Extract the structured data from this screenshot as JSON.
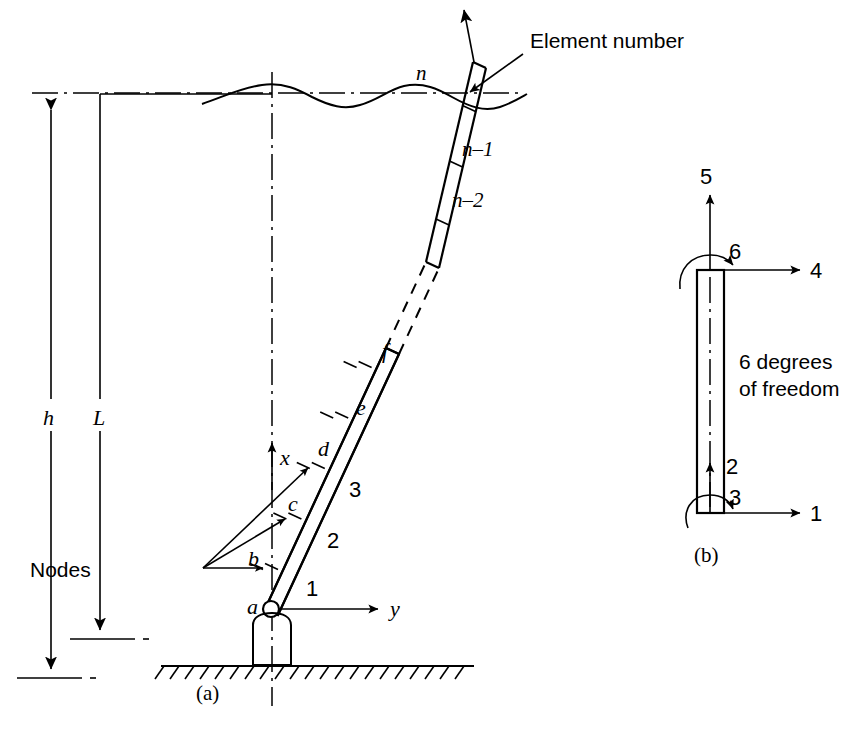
{
  "figure": {
    "domain": "engineering-diagram",
    "background": "#ffffff",
    "ink": "#000000",
    "panels": [
      {
        "key": "a",
        "caption": "(a)",
        "description": "Offshore pile / column discretized into finite elements with nodes, water surface wave, and global x-y axes"
      },
      {
        "key": "b",
        "caption": "(b)",
        "description": "Single beam element showing its six degrees of freedom"
      }
    ]
  },
  "panel_a": {
    "caption": "(a)",
    "annotation_element_number": "Element number",
    "annotation_nodes": "Nodes",
    "dimensions": [
      {
        "name": "h",
        "label": "h",
        "meaning": "total height from mudline to top"
      },
      {
        "name": "L",
        "label": "L",
        "meaning": "submerged / water depth length"
      }
    ],
    "axes": [
      {
        "name": "x-axis",
        "label": "x",
        "direction": "up"
      },
      {
        "name": "y-axis",
        "label": "y",
        "direction": "right"
      }
    ],
    "element_numbers": [
      "1",
      "2",
      "3",
      "n–2",
      "n–1",
      "n"
    ],
    "node_labels": [
      "a",
      "b",
      "c",
      "d",
      "e",
      "f"
    ],
    "support": "pinned-base-on-hatched-ground"
  },
  "panel_b": {
    "caption": "(b)",
    "note_line1": "6 degrees",
    "note_line2": "of freedom",
    "dof": [
      {
        "id": "1",
        "label": "1",
        "type": "translation",
        "direction": "right",
        "location": "bottom"
      },
      {
        "id": "2",
        "label": "2",
        "type": "translation",
        "direction": "up",
        "location": "bottom"
      },
      {
        "id": "3",
        "label": "3",
        "type": "rotation",
        "direction": "ccw",
        "location": "bottom"
      },
      {
        "id": "4",
        "label": "4",
        "type": "translation",
        "direction": "right",
        "location": "top"
      },
      {
        "id": "5",
        "label": "5",
        "type": "translation",
        "direction": "up",
        "location": "top"
      },
      {
        "id": "6",
        "label": "6",
        "type": "rotation",
        "direction": "ccw",
        "location": "top"
      }
    ]
  }
}
